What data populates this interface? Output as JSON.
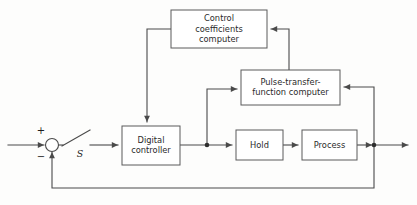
{
  "diagram": {
    "type": "block-diagram",
    "canvas": {
      "width": 417,
      "height": 205
    },
    "colors": {
      "background": "#fdfdfc",
      "box_fill": "#ffffff",
      "box_stroke": "#5a5a5a",
      "wire": "#4a4a4a",
      "text": "#2b2b2b",
      "junction": "#2e2e2e"
    },
    "blocks": [
      {
        "id": "control-coefficients-computer",
        "lines": [
          "Control",
          "coefficients",
          "computer"
        ],
        "x": 171,
        "y": 10,
        "w": 96,
        "h": 38
      },
      {
        "id": "pulse-transfer-function-computer",
        "lines": [
          "Pulse-transfer-",
          "function computer"
        ],
        "x": 241,
        "y": 70,
        "w": 99,
        "h": 35
      },
      {
        "id": "digital-controller",
        "lines": [
          "Digital",
          "controller"
        ],
        "x": 122,
        "y": 126,
        "w": 58,
        "h": 39
      },
      {
        "id": "hold",
        "lines": [
          "Hold"
        ],
        "x": 236,
        "y": 130,
        "w": 47,
        "h": 30
      },
      {
        "id": "process",
        "lines": [
          "Process"
        ],
        "x": 302,
        "y": 130,
        "w": 55,
        "h": 30
      }
    ],
    "summing_junction": {
      "id": "summing-junction",
      "cx": 52,
      "cy": 145,
      "r": 6.5,
      "plus_sign": "+",
      "minus_sign": "−",
      "plus_x": 41,
      "plus_y": 134,
      "minus_x": 41,
      "minus_y": 160
    },
    "switch": {
      "id": "sampling-switch",
      "label": "S",
      "label_x": 80,
      "label_y": 157,
      "pivot_x": 62,
      "pivot_y": 145,
      "blade_x": 89,
      "blade_y": 130
    },
    "junction_dots": [
      {
        "id": "controller-output-node",
        "cx": 207,
        "cy": 145,
        "r": 2.3
      },
      {
        "id": "process-output-node",
        "cx": 374,
        "cy": 145,
        "r": 2.3
      }
    ],
    "signal_labels": []
  },
  "wires": [
    {
      "id": "reference-input",
      "d": "M 8 145 L 44 145",
      "arrow": "end"
    },
    {
      "id": "sum-to-switch",
      "d": "M 59 145 L 63 145",
      "arrow": "none"
    },
    {
      "id": "switch-blade",
      "d": "M 62 146 L 90 130",
      "arrow": "none"
    },
    {
      "id": "switch-to-controller",
      "d": "M 90 145 L 118 145",
      "arrow": "end"
    },
    {
      "id": "controller-to-hold",
      "d": "M 180 145 L 232 145",
      "arrow": "end"
    },
    {
      "id": "hold-to-process",
      "d": "M 283 145 L 298 145",
      "arrow": "end"
    },
    {
      "id": "process-to-output-node",
      "d": "M 357 145 L 372 145",
      "arrow": "end"
    },
    {
      "id": "output-to-right",
      "d": "M 374 145 L 408 145",
      "arrow": "end"
    },
    {
      "id": "node-up-to-pulse-computer",
      "d": "M 207 145 L 207 89 L 237 89",
      "arrow": "end"
    },
    {
      "id": "output-node-up-to-pulse-computer",
      "d": "M 374 145 L 374 87 L 344 87",
      "arrow": "end"
    },
    {
      "id": "pulse-up-to-control-coeff",
      "d": "M 289 70 L 289 29 L 271 29",
      "arrow": "end"
    },
    {
      "id": "control-coeff-down-to-controller",
      "d": "M 171 29 L 147 29 L 147 122",
      "arrow": "end"
    },
    {
      "id": "feedback-path",
      "d": "M 374 145 L 374 188 L 52 188 L 52 152",
      "arrow": "end"
    }
  ]
}
